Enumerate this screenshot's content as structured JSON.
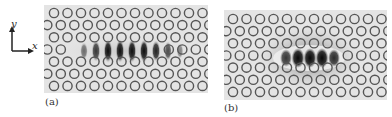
{
  "figure": {
    "axes_indicator": {
      "x_label": "x",
      "y_label": "y"
    },
    "panels": [
      {
        "id": "a",
        "label": "(a)",
        "description": "Photonic crystal lattice of circular holes with an elongated horizontal mode field profile (~9 alternating lobes) along the central row",
        "rows": 7,
        "lattice_pitch_px": 13.5,
        "mode_lobes": 9
      },
      {
        "id": "b",
        "label": "(b)",
        "description": "Photonic crystal lattice of circular holes with a compact mode field profile (~5 lobes) concentrated at the center",
        "rows": 7,
        "lattice_pitch_px": 13.5,
        "mode_lobes": 5
      }
    ],
    "colors": {
      "background": "#e4e4e4",
      "hole_stroke": "#555555",
      "field_dark": "#111111"
    }
  }
}
